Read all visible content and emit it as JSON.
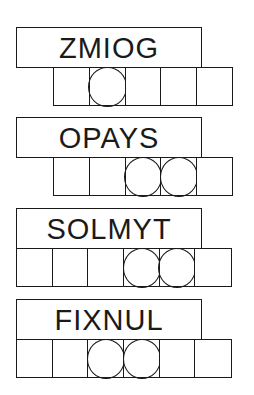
{
  "puzzles": [
    {
      "clue": "ZMIOG",
      "cell_count": 5,
      "offset_cells": 1,
      "circled": [
        1
      ]
    },
    {
      "clue": "OPAYS",
      "cell_count": 5,
      "offset_cells": 1,
      "circled": [
        2,
        3
      ]
    },
    {
      "clue": "SOLMYT",
      "cell_count": 6,
      "offset_cells": 0,
      "circled": [
        3,
        4
      ]
    },
    {
      "clue": "FIXNUL",
      "cell_count": 6,
      "offset_cells": 0,
      "circled": [
        2,
        3
      ]
    }
  ],
  "colors": {
    "line": "#1a1a1a",
    "background": "#ffffff"
  }
}
